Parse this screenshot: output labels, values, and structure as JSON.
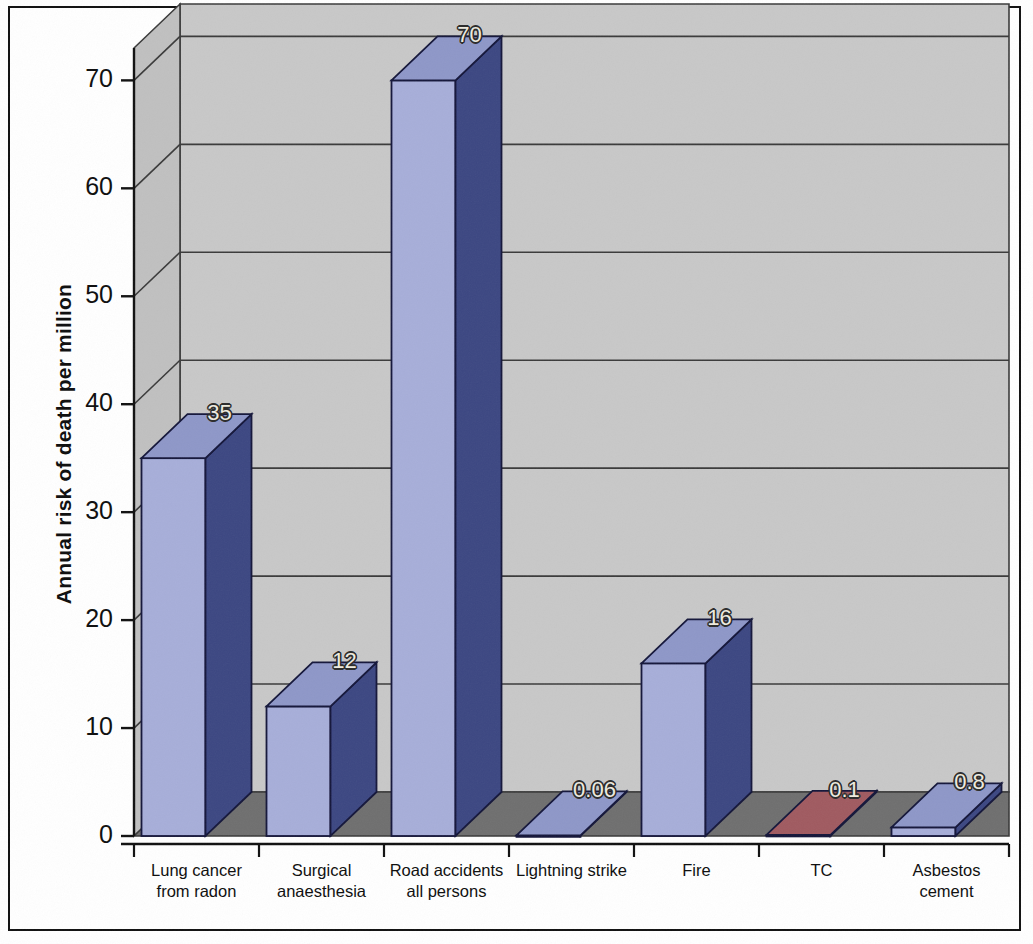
{
  "chart_data": {
    "type": "bar",
    "title": "",
    "subtitle": "",
    "xlabel": "",
    "ylabel": "Annual risk of death per million",
    "ylim": [
      0,
      73
    ],
    "yticks": [
      0,
      10,
      20,
      30,
      40,
      50,
      60,
      70
    ],
    "ytick_labels": [
      "0",
      "10",
      "20",
      "30",
      "40",
      "50",
      "60",
      "70"
    ],
    "grid": true,
    "grid_axis": "y",
    "legend": null,
    "style": "3d-column",
    "categories": [
      "Lung cancer from radon",
      "Surgical anaesthesia",
      "Road accidents all persons",
      "Lightning strike",
      "Fire",
      "TC",
      "Asbestos cement"
    ],
    "category_label_lines": [
      [
        "Lung cancer",
        "from radon"
      ],
      [
        "Surgical",
        "anaesthesia"
      ],
      [
        "Road accidents",
        "all persons"
      ],
      [
        "Lightning strike"
      ],
      [
        "Fire"
      ],
      [
        "TC"
      ],
      [
        "Asbestos",
        "cement"
      ]
    ],
    "values": [
      35,
      12,
      70,
      0.06,
      16,
      0.1,
      0.8
    ],
    "value_labels": [
      "35",
      "12",
      "70",
      "0.06",
      "16",
      "0.1",
      "0.8"
    ],
    "bar_colors": [
      "#a7aed9",
      "#a7aed9",
      "#a7aed9",
      "#a7aed9",
      "#a7aed9",
      "#b6787c",
      "#a7aed9"
    ],
    "bar_side_colors": [
      "#3c4782",
      "#3c4782",
      "#3c4782",
      "#3c4782",
      "#3c4782",
      "#7b3036",
      "#3c4782"
    ],
    "bar_top_colors": [
      "#8e97c8",
      "#8e97c8",
      "#8e97c8",
      "#8e97c8",
      "#8e97c8",
      "#a05a60",
      "#8e97c8"
    ]
  },
  "colors": {
    "wall": "#c8c8c8",
    "wall_side": "#c0c0c0",
    "floor": "#6f6f6f",
    "gridline": "#3a3a3a",
    "axis": "#101010",
    "page_border": "#101010",
    "background": "#ffffff",
    "value_label_text": "#efece0"
  }
}
